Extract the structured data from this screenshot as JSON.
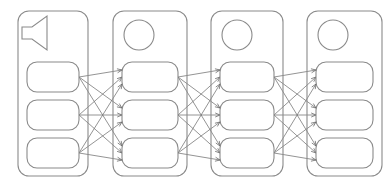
{
  "diagram": {
    "type": "layered-network",
    "canvas": {
      "width": 392,
      "height": 186,
      "background": "#ffffff"
    },
    "style": {
      "panel_stroke": "#8a8a8a",
      "node_stroke": "#8a8a8a",
      "node_fill": "#ffffff",
      "edge_stroke": "#707070",
      "arrowhead_stroke": "#606060",
      "panel_corner_radius": 11,
      "node_corner_radius": 10,
      "panel_stroke_width": 1.1,
      "edge_stroke_width": 0.75
    },
    "panels": [
      {
        "id": "layer-1",
        "label": "Layer 1",
        "icon": "speaker-icon",
        "x": 18,
        "y": 11,
        "width": 70,
        "height": 165,
        "nodes": [
          {
            "id": "l1-n1",
            "x": 27,
            "y": 62,
            "width": 52,
            "height": 30
          },
          {
            "id": "l1-n2",
            "x": 27,
            "y": 100,
            "width": 52,
            "height": 30
          },
          {
            "id": "l1-n3",
            "x": 27,
            "y": 138,
            "width": 52,
            "height": 30
          }
        ]
      },
      {
        "id": "layer-2",
        "label": "Layer 2",
        "icon": "circle-icon",
        "x": 113,
        "y": 11,
        "width": 74,
        "height": 165,
        "nodes": [
          {
            "id": "l2-n1",
            "x": 122,
            "y": 62,
            "width": 56,
            "height": 30
          },
          {
            "id": "l2-n2",
            "x": 122,
            "y": 100,
            "width": 56,
            "height": 30
          },
          {
            "id": "l2-n3",
            "x": 122,
            "y": 138,
            "width": 56,
            "height": 30
          }
        ]
      },
      {
        "id": "layer-3",
        "label": "Layer 3",
        "icon": "circle-icon",
        "x": 211,
        "y": 11,
        "width": 72,
        "height": 165,
        "nodes": [
          {
            "id": "l3-n1",
            "x": 220,
            "y": 62,
            "width": 54,
            "height": 30
          },
          {
            "id": "l3-n2",
            "x": 220,
            "y": 100,
            "width": 54,
            "height": 30
          },
          {
            "id": "l3-n3",
            "x": 220,
            "y": 138,
            "width": 54,
            "height": 30
          }
        ]
      },
      {
        "id": "layer-4",
        "label": "Layer 4",
        "icon": "circle-icon",
        "x": 307,
        "y": 11,
        "width": 75,
        "height": 165,
        "nodes": [
          {
            "id": "l4-n1",
            "x": 316,
            "y": 62,
            "width": 57,
            "height": 30
          },
          {
            "id": "l4-n2",
            "x": 316,
            "y": 100,
            "width": 57,
            "height": 30
          },
          {
            "id": "l4-n3",
            "x": 316,
            "y": 138,
            "width": 57,
            "height": 30
          }
        ]
      }
    ],
    "icons": {
      "speaker": {
        "name": "speaker-icon",
        "panel": "layer-1",
        "points": "22,27 32,27 47,16 47,50 32,39 22,39",
        "description": "horn / loudspeaker outline pointing right"
      },
      "circles": [
        {
          "name": "circle-icon",
          "panel": "layer-2",
          "cx": 139,
          "cy": 35,
          "r": 15
        },
        {
          "name": "circle-icon",
          "panel": "layer-3",
          "cx": 237,
          "cy": 35,
          "r": 15
        },
        {
          "name": "circle-icon",
          "panel": "layer-4",
          "cx": 333,
          "cy": 35,
          "r": 15
        }
      ]
    },
    "connections": {
      "pattern": "fully-connected",
      "arrow_count_per_gap": 9,
      "total_arrows": 27,
      "gaps": [
        {
          "from_layer": "layer-1",
          "to_layer": "layer-2",
          "from_x": 79,
          "to_x": 122
        },
        {
          "from_layer": "layer-2",
          "to_layer": "layer-3",
          "from_x": 178,
          "to_x": 220
        },
        {
          "from_layer": "layer-3",
          "to_layer": "layer-4",
          "from_x": 274,
          "to_x": 316
        }
      ],
      "source_y": [
        77,
        115,
        153
      ],
      "target_y_offsets": [
        -7,
        0,
        7
      ]
    }
  }
}
